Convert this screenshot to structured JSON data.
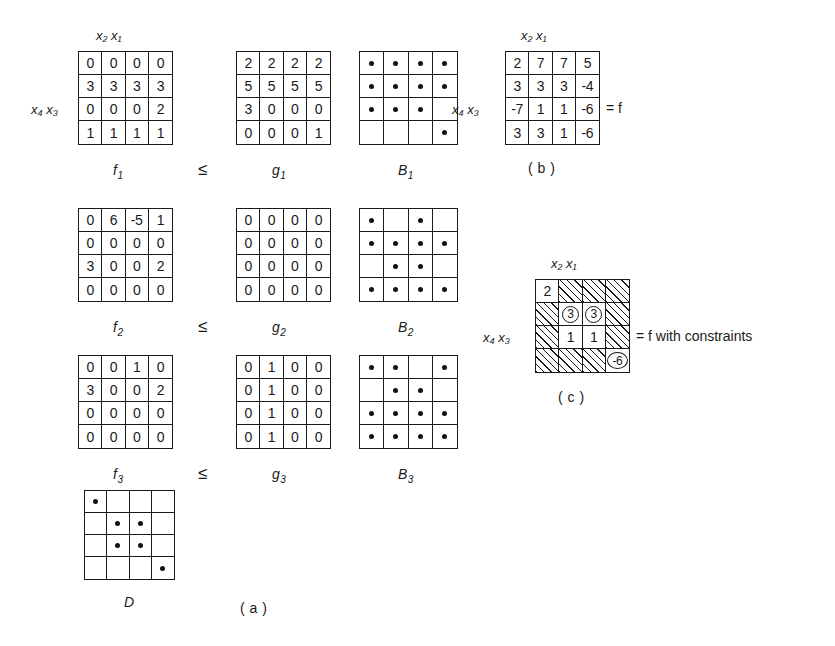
{
  "figure": {
    "axis_labels": {
      "cols": "x₂ x₁",
      "rows": "x₄ x₃"
    },
    "operator": "≤",
    "panel_a_tag": "( a )",
    "panel_b_tag": "( b )",
    "panel_c_tag": "( c )",
    "equals_f": "= f",
    "equals_f_constraints": "= f  with constraints"
  },
  "labels": {
    "f1": {
      "base": "f",
      "sub": "1"
    },
    "f2": {
      "base": "f",
      "sub": "2"
    },
    "f3": {
      "base": "f",
      "sub": "3"
    },
    "g1": {
      "base": "g",
      "sub": "1"
    },
    "g2": {
      "base": "g",
      "sub": "2"
    },
    "g3": {
      "base": "g",
      "sub": "3"
    },
    "B1": {
      "base": "B",
      "sub": "1"
    },
    "B2": {
      "base": "B",
      "sub": "2"
    },
    "B3": {
      "base": "B",
      "sub": "3"
    },
    "D": {
      "base": "D",
      "sub": ""
    }
  },
  "chart_data": {
    "type": "table",
    "xlabel": "x2 x1",
    "ylabel": "x4 x3",
    "grids": {
      "f1": [
        [
          "0",
          "0",
          "0",
          "0"
        ],
        [
          "3",
          "3",
          "3",
          "3"
        ],
        [
          "0",
          "0",
          "0",
          "2"
        ],
        [
          "1",
          "1",
          "1",
          "1"
        ]
      ],
      "g1": [
        [
          "2",
          "2",
          "2",
          "2"
        ],
        [
          "5",
          "5",
          "5",
          "5"
        ],
        [
          "3",
          "0",
          "0",
          "0"
        ],
        [
          "0",
          "0",
          "0",
          "1"
        ]
      ],
      "B1": [
        [
          1,
          1,
          1,
          1
        ],
        [
          1,
          1,
          1,
          1
        ],
        [
          1,
          1,
          1,
          0
        ],
        [
          0,
          0,
          0,
          1
        ]
      ],
      "f2": [
        [
          "0",
          "6",
          "-5",
          "1"
        ],
        [
          "0",
          "0",
          "0",
          "0"
        ],
        [
          "3",
          "0",
          "0",
          "2"
        ],
        [
          "0",
          "0",
          "0",
          "0"
        ]
      ],
      "g2": [
        [
          "0",
          "0",
          "0",
          "0"
        ],
        [
          "0",
          "0",
          "0",
          "0"
        ],
        [
          "0",
          "0",
          "0",
          "0"
        ],
        [
          "0",
          "0",
          "0",
          "0"
        ]
      ],
      "B2": [
        [
          1,
          0,
          1,
          0
        ],
        [
          1,
          1,
          1,
          1
        ],
        [
          0,
          1,
          1,
          0
        ],
        [
          1,
          1,
          1,
          1
        ]
      ],
      "f3": [
        [
          "0",
          "0",
          "1",
          "0"
        ],
        [
          "3",
          "0",
          "0",
          "2"
        ],
        [
          "0",
          "0",
          "0",
          "0"
        ],
        [
          "0",
          "0",
          "0",
          "0"
        ]
      ],
      "g3": [
        [
          "0",
          "1",
          "0",
          "0"
        ],
        [
          "0",
          "1",
          "0",
          "0"
        ],
        [
          "0",
          "1",
          "0",
          "0"
        ],
        [
          "0",
          "1",
          "0",
          "0"
        ]
      ],
      "B3": [
        [
          1,
          1,
          0,
          1
        ],
        [
          0,
          1,
          1,
          0
        ],
        [
          1,
          1,
          1,
          1
        ],
        [
          1,
          1,
          1,
          1
        ]
      ],
      "D": [
        [
          1,
          0,
          0,
          0
        ],
        [
          0,
          1,
          1,
          0
        ],
        [
          0,
          1,
          1,
          0
        ],
        [
          0,
          0,
          0,
          1
        ]
      ],
      "f": [
        [
          "2",
          "7",
          "7",
          "5"
        ],
        [
          "3",
          "3",
          "3",
          "-4"
        ],
        [
          "-7",
          "1",
          "1",
          "-6"
        ],
        [
          "3",
          "3",
          "1",
          "-6"
        ]
      ],
      "f_constraints": [
        [
          {
            "v": "2",
            "s": "plain"
          },
          {
            "v": "",
            "s": "hatch"
          },
          {
            "v": "",
            "s": "hatch"
          },
          {
            "v": "",
            "s": "hatch"
          }
        ],
        [
          {
            "v": "",
            "s": "hatch"
          },
          {
            "v": "3",
            "s": "circled"
          },
          {
            "v": "3",
            "s": "circled"
          },
          {
            "v": "",
            "s": "hatch"
          }
        ],
        [
          {
            "v": "",
            "s": "hatch"
          },
          {
            "v": "1",
            "s": "plain"
          },
          {
            "v": "1",
            "s": "plain"
          },
          {
            "v": "",
            "s": "hatch"
          }
        ],
        [
          {
            "v": "",
            "s": "hatch"
          },
          {
            "v": "",
            "s": "hatch"
          },
          {
            "v": "",
            "s": "hatch"
          },
          {
            "v": "-6",
            "s": "circled-wide"
          }
        ]
      ]
    }
  }
}
